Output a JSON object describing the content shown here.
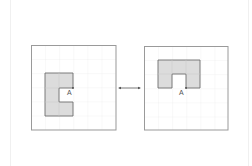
{
  "diagram": {
    "grid_size": 6,
    "panels": [
      {
        "id": "before",
        "point_label": "A",
        "shape": "C-shape opening to the right (6 grid cells filled)"
      },
      {
        "id": "after",
        "point_label": "A",
        "shape": "C-shape opening downward (6 grid cells filled)"
      }
    ],
    "connector": "double-headed-arrow",
    "colors": {
      "frame": "#9a9a9a",
      "grid": "#e6e6e6",
      "shape_fill": "#dcdcdc",
      "shape_stroke": "#6e6e6e",
      "arrow": "#555555"
    }
  }
}
